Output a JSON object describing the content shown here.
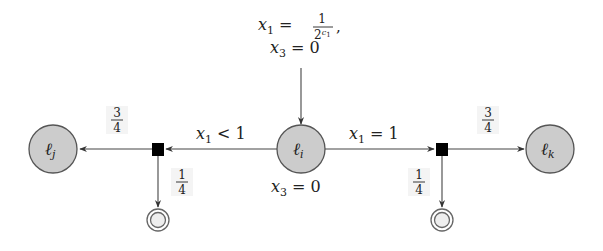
{
  "diagram": {
    "nodes": {
      "center": {
        "name": "ℓ",
        "sub": "i"
      },
      "left": {
        "name": "ℓ",
        "sub": "j"
      },
      "right": {
        "name": "ℓ",
        "sub": "k"
      }
    },
    "incoming": {
      "line1": {
        "var": "x",
        "sub": "1",
        "op": " = ",
        "num": "1",
        "den_base": "2",
        "den_exp": "c",
        "den_exp_sub": "1",
        "trail": ","
      },
      "line2": {
        "var": "x",
        "sub": "3",
        "op": " = 0"
      }
    },
    "edges": {
      "left_guard": {
        "var": "x",
        "sub": "1",
        "op": " < 1"
      },
      "right_guard": {
        "var": "x",
        "sub": "1",
        "op": " = 1"
      },
      "center_update": {
        "var": "x",
        "sub": "3",
        "op": " = 0"
      }
    },
    "probabilities": {
      "left_to_lj": {
        "num": "3",
        "den": "4"
      },
      "left_to_terminal": {
        "num": "1",
        "den": "4"
      },
      "right_to_lk": {
        "num": "3",
        "den": "4"
      },
      "right_to_terminal": {
        "num": "1",
        "den": "4"
      }
    },
    "colors": {
      "node_fill": "#cccccc",
      "node_stroke": "#555555",
      "chance_fill": "#000000",
      "edge": "#444444"
    }
  }
}
